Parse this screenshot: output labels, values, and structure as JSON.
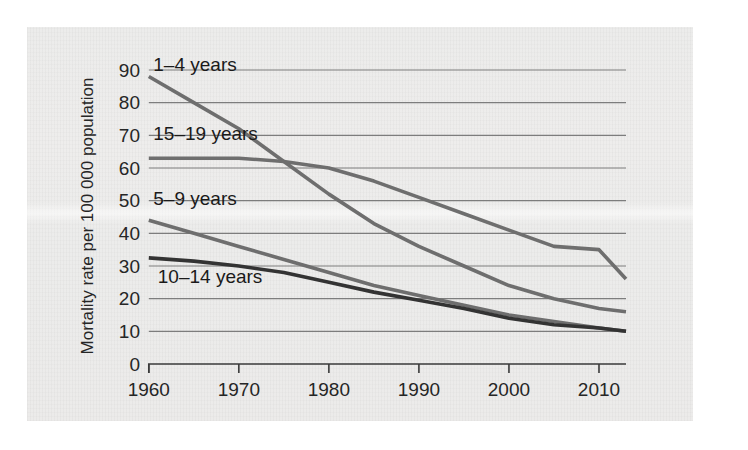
{
  "chart_data": {
    "type": "line",
    "title": "",
    "xlabel": "",
    "ylabel": "Mortality rate per 100 000 population",
    "xlim": [
      1960,
      2013
    ],
    "ylim": [
      0,
      95
    ],
    "grid": true,
    "legend_position": "inline-labels",
    "xticks": [
      "1960",
      "1970",
      "1980",
      "1990",
      "2000",
      "2010"
    ],
    "xtick_values": [
      1960,
      1970,
      1980,
      1990,
      2000,
      2010
    ],
    "yticks": [
      "0",
      "10",
      "20",
      "30",
      "40",
      "50",
      "60",
      "70",
      "80",
      "90"
    ],
    "ytick_values": [
      0,
      10,
      20,
      30,
      40,
      50,
      60,
      70,
      80,
      90
    ],
    "series": [
      {
        "name": "1–4 years",
        "color": "#6e6e6e",
        "width": 3.6,
        "label_x": 1960.5,
        "label_y": 91.5,
        "x": [
          1960,
          1965,
          1970,
          1975,
          1980,
          1985,
          1990,
          1995,
          2000,
          2005,
          2010,
          2013
        ],
        "values": [
          88,
          80,
          72,
          62,
          52,
          43,
          36,
          30,
          24,
          20,
          17,
          16
        ]
      },
      {
        "name": "15–19 years",
        "color": "#6e6e6e",
        "width": 3.6,
        "label_x": 1960.5,
        "label_y": 70.5,
        "x": [
          1960,
          1965,
          1970,
          1975,
          1980,
          1985,
          1990,
          1995,
          2000,
          2005,
          2010,
          2013
        ],
        "values": [
          63,
          63,
          63,
          62,
          60,
          56,
          51,
          46,
          41,
          36,
          35,
          26
        ]
      },
      {
        "name": "5–9 years",
        "color": "#6e6e6e",
        "width": 3.6,
        "label_x": 1960.5,
        "label_y": 50.5,
        "x": [
          1960,
          1965,
          1970,
          1975,
          1980,
          1985,
          1990,
          1995,
          2000,
          2005,
          2010,
          2013
        ],
        "values": [
          44,
          40,
          36,
          32,
          28,
          24,
          21,
          18,
          15,
          13,
          11,
          10
        ]
      },
      {
        "name": "10–14 years",
        "color": "#333333",
        "width": 3.6,
        "label_x": 1961.0,
        "label_y": 26.5,
        "x": [
          1960,
          1965,
          1970,
          1975,
          1980,
          1985,
          1990,
          1995,
          2000,
          2005,
          2010,
          2013
        ],
        "values": [
          32.5,
          31.5,
          30,
          28,
          25,
          22,
          19.5,
          17,
          14,
          12,
          11,
          10
        ]
      }
    ]
  }
}
